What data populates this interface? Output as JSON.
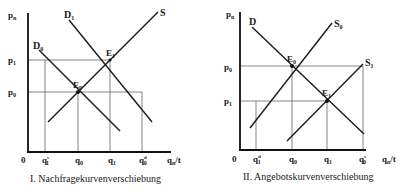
{
  "diagrams": [
    {
      "caption": "I. Nachfragekurvenverschiebung",
      "y_axis_label": "p",
      "y_axis_sub": "n",
      "x_axis_label": "q",
      "x_axis_sub": "n",
      "x_axis_suffix": "/t",
      "origin": "0",
      "price_ticks": [
        {
          "base": "p",
          "sub": "1"
        },
        {
          "base": "p",
          "sub": "0"
        }
      ],
      "quantity_ticks": [
        {
          "base": "q",
          "sub": "1",
          "sup": "s"
        },
        {
          "base": "q",
          "sub": "0",
          "sup": ""
        },
        {
          "base": "q",
          "sub": "1",
          "sup": ""
        },
        {
          "base": "q",
          "sub": "0",
          "sup": "d"
        }
      ],
      "curves": [
        {
          "base": "D",
          "sub": "0"
        },
        {
          "base": "D",
          "sub": "1"
        },
        {
          "base": "S",
          "sub": ""
        }
      ],
      "equilibria": [
        {
          "base": "E",
          "sub": "0"
        },
        {
          "base": "E",
          "sub": "1"
        }
      ]
    },
    {
      "caption": "II. Angebotskurvenverschiebung",
      "y_axis_label": "p",
      "y_axis_sub": "n",
      "x_axis_label": "q",
      "x_axis_sub": "n",
      "x_axis_suffix": "/t",
      "origin": "0",
      "price_ticks": [
        {
          "base": "p",
          "sub": "0"
        },
        {
          "base": "p",
          "sub": "1"
        }
      ],
      "quantity_ticks": [
        {
          "base": "q",
          "sub": "1",
          "sup": "d"
        },
        {
          "base": "q",
          "sub": "0",
          "sup": ""
        },
        {
          "base": "q",
          "sub": "1",
          "sup": ""
        },
        {
          "base": "q",
          "sub": "0",
          "sup": "s"
        }
      ],
      "curves": [
        {
          "base": "D",
          "sub": ""
        },
        {
          "base": "S",
          "sub": "0"
        },
        {
          "base": "S",
          "sub": "1"
        }
      ],
      "equilibria": [
        {
          "base": "E",
          "sub": "0"
        },
        {
          "base": "E",
          "sub": "1"
        }
      ]
    }
  ]
}
